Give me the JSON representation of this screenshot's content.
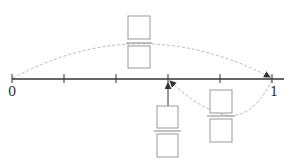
{
  "number_line": {
    "start_label": "0",
    "end_label": "1",
    "divisions": 5,
    "ticks": [
      0,
      0.2,
      0.4,
      0.6,
      0.8,
      1.0
    ],
    "colors": {
      "axis": "#333333",
      "box": "#999999",
      "dashed_arc": "#b0b0b0"
    }
  },
  "fraction_blanks": [
    {
      "id": "whole-jump",
      "numerator": "",
      "denominator": "",
      "describes": "jump from 0 to 1"
    },
    {
      "id": "target-point",
      "numerator": "",
      "denominator": "",
      "describes": "marked point at 3/5"
    },
    {
      "id": "back-jump",
      "numerator": "",
      "denominator": "",
      "describes": "jump back from 1 to 3/5"
    }
  ],
  "marked_point": 0.6
}
